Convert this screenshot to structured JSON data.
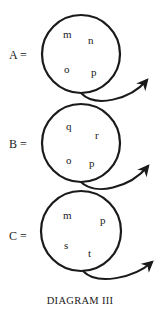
{
  "diagram": {
    "caption": "DIAGRAM III",
    "stroke_color": "#1a1a1a",
    "sets": [
      {
        "label": "A =",
        "elements": [
          "m",
          "n",
          "o",
          "p"
        ]
      },
      {
        "label": "B =",
        "elements": [
          "q",
          "r",
          "o",
          "p"
        ]
      },
      {
        "label": "C =",
        "elements": [
          "m",
          "p",
          "s",
          "t"
        ]
      }
    ]
  }
}
